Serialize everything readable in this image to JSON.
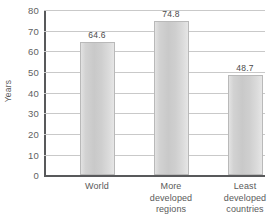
{
  "chart_data": {
    "type": "bar",
    "title": "",
    "xlabel": "",
    "ylabel": "Years",
    "categories": [
      "World",
      "More developed regions",
      "Least developed countries"
    ],
    "category_lines": [
      [
        "World"
      ],
      [
        "More",
        "developed",
        "regions"
      ],
      [
        "Least",
        "developed",
        "countries"
      ]
    ],
    "values": [
      64.6,
      74.8,
      48.7
    ],
    "value_labels": [
      "64.6",
      "74.8",
      "48.7"
    ],
    "ylim": [
      0,
      80
    ],
    "ytick_labels": [
      "80",
      "70",
      "60",
      "50",
      "40",
      "30",
      "20",
      "10",
      "0"
    ],
    "ytick_values": [
      80,
      70,
      60,
      50,
      40,
      30,
      20,
      10,
      0
    ],
    "grid": true,
    "legend": "none",
    "colors": {
      "bar_fill": "#d2d2d2",
      "bar_edge": "#b9b9b9",
      "gridline": "#c9c9c9",
      "axis": "#58595b",
      "text": "#5a5a5a",
      "background": "#ffffff"
    }
  }
}
